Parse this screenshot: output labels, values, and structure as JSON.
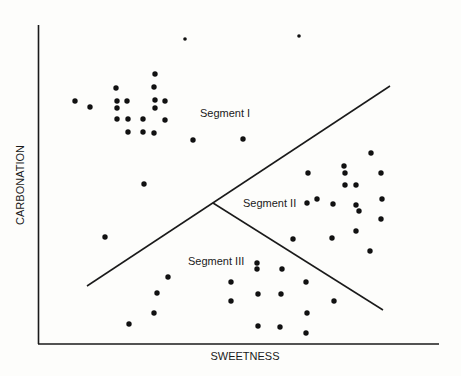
{
  "chart_data": {
    "type": "scatter",
    "title": "",
    "xlabel": "SWEETNESS",
    "ylabel": "CARBONATION",
    "grid": false,
    "legend": null,
    "annotations": [
      {
        "text": "Segment I",
        "x": 200,
        "y": 117
      },
      {
        "text": "Segment II",
        "x": 243,
        "y": 207
      },
      {
        "text": "Segment III",
        "x": 188,
        "y": 265
      }
    ],
    "boundaries": [
      {
        "from": [
          87,
          286
        ],
        "to": [
          390,
          86
        ]
      },
      {
        "from": [
          213,
          203
        ],
        "to": [
          383,
          310
        ]
      }
    ],
    "series": [
      {
        "name": "Segment I",
        "points": [
          [
            185,
            39
          ],
          [
            299,
            36
          ],
          [
            155,
            74
          ],
          [
            116,
            88
          ],
          [
            154,
            87
          ],
          [
            75,
            101
          ],
          [
            117,
            101
          ],
          [
            127,
            101
          ],
          [
            155,
            100
          ],
          [
            165,
            101
          ],
          [
            90,
            107
          ],
          [
            117,
            108
          ],
          [
            155,
            108
          ],
          [
            117,
            119
          ],
          [
            128,
            119
          ],
          [
            143,
            119
          ],
          [
            165,
            120
          ],
          [
            128,
            132
          ],
          [
            143,
            132
          ],
          [
            154,
            133
          ],
          [
            193,
            140
          ],
          [
            243,
            139
          ],
          [
            144,
            184
          ],
          [
            105,
            237
          ]
        ]
      },
      {
        "name": "Segment II",
        "points": [
          [
            371,
            153
          ],
          [
            344,
            166
          ],
          [
            308,
            173
          ],
          [
            345,
            173
          ],
          [
            381,
            173
          ],
          [
            345,
            185
          ],
          [
            356,
            185
          ],
          [
            317,
            199
          ],
          [
            307,
            203
          ],
          [
            382,
            199
          ],
          [
            333,
            204
          ],
          [
            356,
            205
          ],
          [
            359,
            211
          ],
          [
            381,
            219
          ],
          [
            356,
            231
          ],
          [
            293,
            239
          ],
          [
            332,
            238
          ],
          [
            370,
            251
          ]
        ]
      },
      {
        "name": "Segment III",
        "points": [
          [
            257,
            263
          ],
          [
            257,
            269
          ],
          [
            282,
            269
          ],
          [
            168,
            277
          ],
          [
            231,
            282
          ],
          [
            306,
            282
          ],
          [
            157,
            293
          ],
          [
            258,
            294
          ],
          [
            281,
            294
          ],
          [
            231,
            301
          ],
          [
            334,
            301
          ],
          [
            154,
            313
          ],
          [
            307,
            313
          ],
          [
            129,
            324
          ],
          [
            258,
            326
          ],
          [
            280,
            327
          ],
          [
            306,
            333
          ]
        ]
      }
    ]
  },
  "axes": {
    "x_label": "SWEETNESS",
    "y_label": "CARBONATION"
  },
  "segments": {
    "one": "Segment I",
    "two": "Segment II",
    "three": "Segment III"
  }
}
